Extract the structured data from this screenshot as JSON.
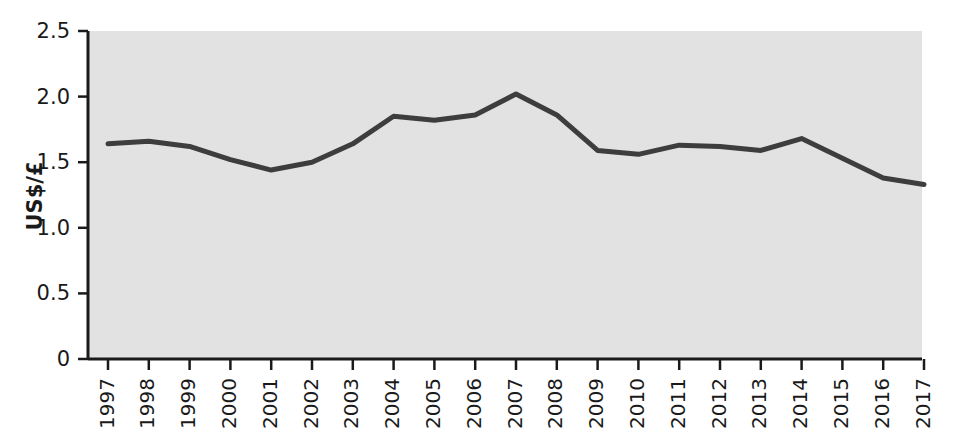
{
  "chart_data": {
    "type": "line",
    "title": "",
    "xlabel": "",
    "ylabel": "US$/£",
    "x": [
      1997,
      1998,
      1999,
      2000,
      2001,
      2002,
      2003,
      2004,
      2005,
      2006,
      2007,
      2008,
      2009,
      2010,
      2011,
      2012,
      2013,
      2014,
      2015,
      2016,
      2017
    ],
    "categories": [
      "1997",
      "1998",
      "1999",
      "2000",
      "2001",
      "2002",
      "2003",
      "2004",
      "2005",
      "2006",
      "2007",
      "2008",
      "2009",
      "2010",
      "2011",
      "2012",
      "2013",
      "2014",
      "2015",
      "2016",
      "2017"
    ],
    "values": [
      1.64,
      1.66,
      1.62,
      1.52,
      1.44,
      1.5,
      1.64,
      1.85,
      1.82,
      1.86,
      2.02,
      1.86,
      1.59,
      1.56,
      1.63,
      1.62,
      1.59,
      1.68,
      1.53,
      1.38,
      1.33
    ],
    "series": [
      {
        "name": "US$/£ exchange rate",
        "values": [
          1.64,
          1.66,
          1.62,
          1.52,
          1.44,
          1.5,
          1.64,
          1.85,
          1.82,
          1.86,
          2.02,
          1.86,
          1.59,
          1.56,
          1.63,
          1.62,
          1.59,
          1.68,
          1.53,
          1.38,
          1.33
        ],
        "color": "#3d3d3d"
      }
    ],
    "ylim": [
      0,
      2.5
    ],
    "yticks": [
      0,
      0.5,
      1.0,
      1.5,
      2.0,
      2.5
    ],
    "ytick_labels": [
      "0",
      "0.5",
      "1.0",
      "1.5",
      "2.0",
      "2.5"
    ],
    "grid": false,
    "legend": false,
    "legend_position": "none",
    "xtick_rotation": 90,
    "plot_background_color": "#e2e2e2",
    "line_color": "#3d3d3d",
    "line_width": 5,
    "axis_color": "#1a1a1a",
    "figure_background_color": "#ffffff"
  }
}
